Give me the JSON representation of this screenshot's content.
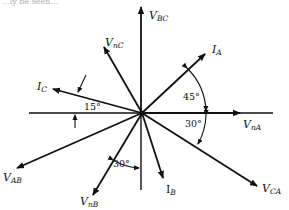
{
  "diagram": {
    "type": "phasor-diagram",
    "center": [
      142,
      113
    ],
    "color": "#111111",
    "phasors": [
      {
        "id": "VnA",
        "label_main": "V",
        "label_sub": "nA",
        "angle_deg": 0,
        "tip": [
          240,
          113
        ],
        "label_pos": [
          246,
          128
        ]
      },
      {
        "id": "IA",
        "label_main": "I",
        "label_sub": "A",
        "angle_deg": 45,
        "tip": [
          205,
          54
        ],
        "label_pos": [
          212,
          53
        ]
      },
      {
        "id": "VBC",
        "label_main": "V",
        "label_sub": "BC",
        "angle_deg": 90,
        "tip": [
          141,
          7
        ],
        "label_pos": [
          149,
          19
        ]
      },
      {
        "id": "VnC",
        "label_main": "V",
        "label_sub": "nC",
        "angle_deg": 120,
        "tip": [
          104,
          47
        ],
        "label_pos": [
          106,
          46
        ]
      },
      {
        "id": "IC",
        "label_main": "I",
        "label_sub": "C",
        "angle_deg": 165,
        "tip": [
          53,
          89
        ],
        "label_pos": [
          38,
          90
        ]
      },
      {
        "id": "VAB",
        "label_main": "V",
        "label_sub": "AB",
        "angle_deg": 210,
        "tip": [
          17,
          168
        ],
        "label_pos": [
          3,
          180
        ]
      },
      {
        "id": "VnB",
        "label_main": "V",
        "label_sub": "nB",
        "angle_deg": 240,
        "tip": [
          93,
          195
        ],
        "label_pos": [
          80,
          207
        ]
      },
      {
        "id": "IB",
        "label_main": "I",
        "label_sub": "B",
        "angle_deg": 285,
        "tip": [
          163,
          178
        ],
        "label_pos": [
          166,
          193
        ]
      },
      {
        "id": "VCA",
        "label_main": "V",
        "label_sub": "CA",
        "angle_deg": 330,
        "tip": [
          257,
          186
        ],
        "label_pos": [
          264,
          193
        ]
      }
    ],
    "reference_lines": {
      "horizontal": {
        "from": [
          29,
          113
        ],
        "to": [
          273,
          113
        ]
      },
      "vertical": {
        "from": [
          141,
          113
        ],
        "to": [
          141,
          190
        ]
      }
    },
    "angle_annotations": [
      {
        "id": "angle-IA-VnA",
        "text": "45°",
        "pos": [
          181,
          100
        ]
      },
      {
        "id": "angle-VnA-VCA",
        "text": "30°",
        "pos": [
          185,
          126
        ]
      },
      {
        "id": "angle-IC-ref",
        "text": "15°",
        "pos": [
          84,
          111
        ]
      },
      {
        "id": "angle-VnB-ref",
        "text": "30°",
        "pos": [
          113,
          168
        ]
      }
    ],
    "top_clipped_text": "...ly be seen..."
  }
}
